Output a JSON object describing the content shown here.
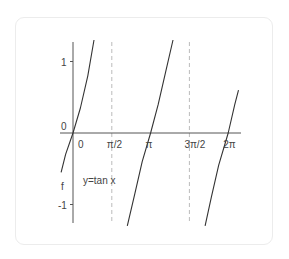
{
  "chart_data": {
    "type": "line",
    "title": "",
    "annotation": "y=tan x",
    "ylabel": "f",
    "xlabel": "",
    "x_ticks": [
      "0",
      "π/2",
      "π",
      "3π/2",
      "2π"
    ],
    "x_tick_values": [
      0,
      1.5708,
      3.1416,
      4.7124,
      6.2832
    ],
    "y_ticks": [
      "1",
      "0",
      "-1"
    ],
    "y_tick_values": [
      1,
      0,
      -1
    ],
    "xlim": [
      -0.5,
      6.7
    ],
    "ylim": [
      -1.3,
      1.3
    ],
    "asymptotes": [
      1.5708,
      4.7124
    ],
    "grid": false,
    "series": [
      {
        "name": "y=tan x",
        "branches": [
          {
            "x": [
              -0.48,
              -0.3,
              0,
              0.3,
              0.6,
              0.85
            ],
            "y": [
              -0.55,
              -0.3,
              0,
              0.35,
              0.8,
              1.3
            ]
          },
          {
            "x": [
              2.2,
              2.5,
              2.8,
              3.1416,
              3.45,
              3.75,
              4.05
            ],
            "y": [
              -1.3,
              -0.85,
              -0.4,
              0,
              0.4,
              0.85,
              1.3
            ]
          },
          {
            "x": [
              5.35,
              5.6,
              5.9,
              6.2832,
              6.55,
              6.7
            ],
            "y": [
              -1.3,
              -0.9,
              -0.45,
              0,
              0.4,
              0.6
            ]
          }
        ],
        "color": "#333333"
      }
    ],
    "axis_color": "#555555",
    "asymptote_color": "#bbbbbb"
  }
}
